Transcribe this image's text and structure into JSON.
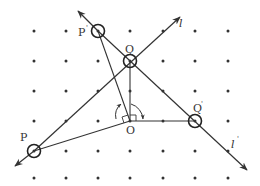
{
  "diagram": {
    "type": "geometry-rotation",
    "labels": {
      "P": "P",
      "P_prime": "P",
      "P_prime_mark": "'",
      "Q": "Q",
      "Q_prime": "Q",
      "Q_prime_mark": "'",
      "O": "O",
      "l": "l",
      "l_prime": "l",
      "l_prime_mark": "'"
    },
    "grid": {
      "columns_x": [
        34,
        66,
        98,
        130,
        163,
        195,
        228
      ],
      "rows_y": [
        31,
        61,
        91,
        121,
        151,
        178
      ],
      "dot_color": "#333333"
    },
    "points": {
      "O": [
        130,
        121
      ],
      "Q": [
        130,
        61
      ],
      "Q_prime": [
        195,
        121
      ],
      "P": [
        34,
        151
      ],
      "P_prime": [
        98,
        31
      ]
    },
    "lines": {
      "l": {
        "from": [
          15,
          166
        ],
        "to": [
          180,
          17
        ],
        "arrow_both": true
      },
      "l_prime": {
        "from": [
          78,
          11
        ],
        "to": [
          247,
          170
        ],
        "arrow_both": true
      }
    },
    "stroke_color": "#333333"
  }
}
